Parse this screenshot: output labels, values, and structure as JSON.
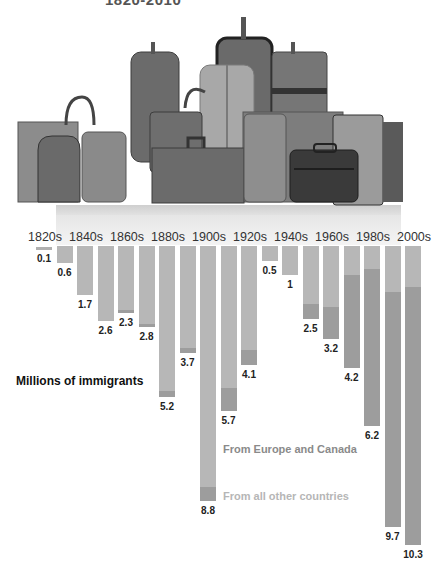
{
  "title": "1820-2010",
  "ylabel": "Millions of immigrants",
  "legend": {
    "europe": "From Europe and Canada",
    "others": "From all other countries"
  },
  "colors": {
    "europe": "#b7b7b7",
    "others": "#9d9d9d"
  },
  "decade_labels": [
    "1820s",
    "1840s",
    "1860s",
    "1880s",
    "1900s",
    "1920s",
    "1940s",
    "1960s",
    "1980s",
    "2000s"
  ],
  "chart_data": {
    "type": "bar",
    "orientation": "vertical-down",
    "stacked": true,
    "title": "1820-2010",
    "ylabel": "Millions of immigrants",
    "xlabel": "",
    "categories": [
      "1820s",
      "1830s",
      "1840s",
      "1850s",
      "1860s",
      "1870s",
      "1880s",
      "1890s",
      "1900s",
      "1910s",
      "1920s",
      "1930s",
      "1940s",
      "1950s",
      "1960s",
      "1970s",
      "1980s",
      "1990s",
      "2000s"
    ],
    "values": [
      0.1,
      0.6,
      1.7,
      2.6,
      2.3,
      2.8,
      5.2,
      3.7,
      8.8,
      5.7,
      4.1,
      0.5,
      1.0,
      2.5,
      3.2,
      4.2,
      6.2,
      9.7,
      10.3
    ],
    "series": [
      {
        "name": "From Europe and Canada",
        "values": [
          0.1,
          0.6,
          1.7,
          2.6,
          2.2,
          2.7,
          5.0,
          3.5,
          8.3,
          4.9,
          3.6,
          0.5,
          1.0,
          2.0,
          2.1,
          1.0,
          0.8,
          1.6,
          1.4
        ]
      },
      {
        "name": "From all other countries",
        "values": [
          0.0,
          0.0,
          0.0,
          0.0,
          0.1,
          0.1,
          0.2,
          0.2,
          0.5,
          0.8,
          0.5,
          0.0,
          0.0,
          0.5,
          1.1,
          3.2,
          5.4,
          8.1,
          8.9
        ]
      }
    ],
    "legend_position": "inside-right-lower",
    "grid": false
  }
}
